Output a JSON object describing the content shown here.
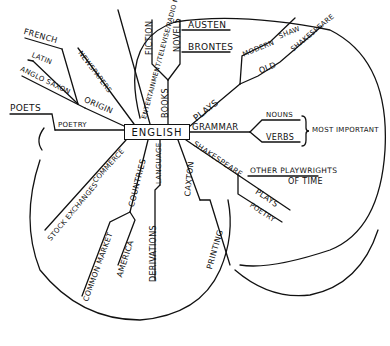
{
  "diagram": {
    "type": "mind-map",
    "center": "ENGLISH",
    "branches": {
      "origin": {
        "label": "ORIGIN",
        "children": [
          "FRENCH",
          "LATIN",
          "ANGLO SAXON"
        ]
      },
      "poetry": {
        "label": "POETRY",
        "children": [
          "POETS"
        ]
      },
      "newspapers": {
        "label": "NEWSPAPERS"
      },
      "entertainment": {
        "label": "ENTERTAINMENT/TELEVISE/RADIO ME"
      },
      "books": {
        "label": "BOOKS",
        "children": {
          "fiction": "FICTION",
          "novels": {
            "label": "NOVELS",
            "children": [
              "AUSTEN",
              "BRONTES"
            ]
          }
        }
      },
      "plays": {
        "label": "PLAYS",
        "children": {
          "modern": {
            "label": "MODERN",
            "children": [
              "SHAW"
            ]
          },
          "old": {
            "label": "OLD",
            "children": [
              "SHAKESPEARE"
            ]
          }
        }
      },
      "grammar": {
        "label": "GRAMMAR",
        "children": [
          "NOUNS",
          "VERBS"
        ],
        "note": "MOST IMPORTANT"
      },
      "shakespeare": {
        "label": "SHAKESPEARE",
        "children": [
          "PLAYS",
          "POETRY"
        ],
        "note_line1": "OTHER PLAYWRIGHTS",
        "note_line2": "OF TIME"
      },
      "commerce": {
        "label": "COMMERCE",
        "children": [
          "STOCK EXCHANGES"
        ]
      },
      "countries": {
        "label": "COUNTRIES",
        "children": [
          "COMMON MARKET",
          "AMERICA"
        ]
      },
      "language": {
        "label": "LANGUAGE",
        "children": [
          "DERIVATIONS"
        ]
      },
      "caxton": {
        "label": "CAXTON",
        "children": [
          "PRINTING"
        ]
      }
    }
  },
  "colors": {
    "ink": "#111111",
    "paper": "#ffffff"
  }
}
